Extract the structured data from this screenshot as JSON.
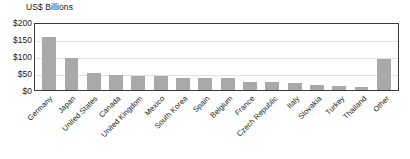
{
  "chart_data": {
    "type": "bar",
    "title": "",
    "subtitle": "",
    "xlabel": "",
    "ylabel": "US$ Billions",
    "ylim": [
      0,
      200
    ],
    "yticks": [
      "$0",
      "$50",
      "$100",
      "$150",
      "$200"
    ],
    "ytick_values": [
      0,
      50,
      100,
      150,
      200
    ],
    "grid": true,
    "legend": false,
    "bar_color": "#a9a9a9",
    "categories": [
      "Germany",
      "Japan",
      "United States",
      "Canada",
      "United Kingdom",
      "Mexico",
      "South Korea",
      "Spain",
      "Belgium",
      "France",
      "Czech Republic",
      "Italy",
      "Slovakia",
      "Turkey",
      "Thailand",
      "Other"
    ],
    "values": [
      155,
      93,
      51,
      45,
      41,
      41,
      36,
      34,
      34,
      25,
      24,
      21,
      16,
      11,
      9,
      90
    ]
  },
  "colors": {
    "bar": "#a9a9a9",
    "frame": "#3a3a3a",
    "grid": "#e2e2e2",
    "text": "#1a1a1a",
    "background": "#ffffff"
  }
}
